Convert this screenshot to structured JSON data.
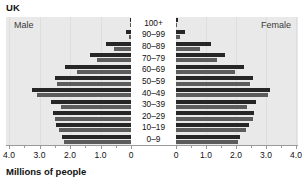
{
  "chart_data": {
    "type": "bar",
    "chart_subtype": "population-pyramid",
    "title": "UK",
    "xlabel": "Millions of people",
    "ylabel": "",
    "left_panel_label": "Male",
    "right_panel_label": "Female",
    "categories": [
      "100+",
      "90–99",
      "80–89",
      "70–79",
      "60–69",
      "50–59",
      "40–49",
      "30–39",
      "20–29",
      "10–19",
      "0–9"
    ],
    "xlim": [
      0,
      4.0
    ],
    "left_tick_labels": [
      "4.0",
      "3.0",
      "2.0",
      "1.0",
      "0"
    ],
    "left_tick_values": [
      4.0,
      3.0,
      2.0,
      1.0,
      0
    ],
    "right_tick_labels": [
      "0",
      "1.0",
      "2.0",
      "3.0",
      "4.0"
    ],
    "right_tick_values": [
      0,
      1.0,
      2.0,
      3.0,
      4.0
    ],
    "grid": true,
    "legend": "none",
    "units": "millions",
    "series": [
      {
        "name": "Male",
        "side": "left",
        "values": [
          0.02,
          0.18,
          0.82,
          1.35,
          2.15,
          2.5,
          3.25,
          2.62,
          2.55,
          2.45,
          2.25
        ],
        "sub_bars": [
          [
            0.02,
            0.01
          ],
          [
            0.18,
            0.05
          ],
          [
            0.82,
            0.55
          ],
          [
            1.35,
            1.12
          ],
          [
            2.15,
            1.78
          ],
          [
            2.5,
            2.42
          ],
          [
            3.25,
            3.08
          ],
          [
            2.62,
            2.3
          ],
          [
            2.55,
            2.48
          ],
          [
            2.45,
            2.35
          ],
          [
            2.25,
            2.2
          ]
        ]
      },
      {
        "name": "Female",
        "side": "right",
        "values": [
          0.08,
          0.3,
          1.15,
          1.62,
          2.28,
          2.58,
          3.12,
          2.65,
          2.6,
          2.42,
          2.12
        ],
        "sub_bars": [
          [
            0.08,
            0.03
          ],
          [
            0.3,
            0.12
          ],
          [
            1.15,
            0.8
          ],
          [
            1.62,
            1.38
          ],
          [
            2.28,
            1.95
          ],
          [
            2.58,
            2.48
          ],
          [
            3.12,
            3.05
          ],
          [
            2.65,
            2.38
          ],
          [
            2.6,
            2.55
          ],
          [
            2.42,
            2.32
          ],
          [
            2.12,
            2.05
          ]
        ]
      }
    ],
    "colors": {
      "bar_dark": "#262626",
      "bar_mid": "#5c5c5c",
      "plot_background": "#e9e9e9",
      "center_background": "#ffffff",
      "gridline": "#dedede",
      "axis": "#9a9a9a",
      "text": "#111111"
    }
  }
}
